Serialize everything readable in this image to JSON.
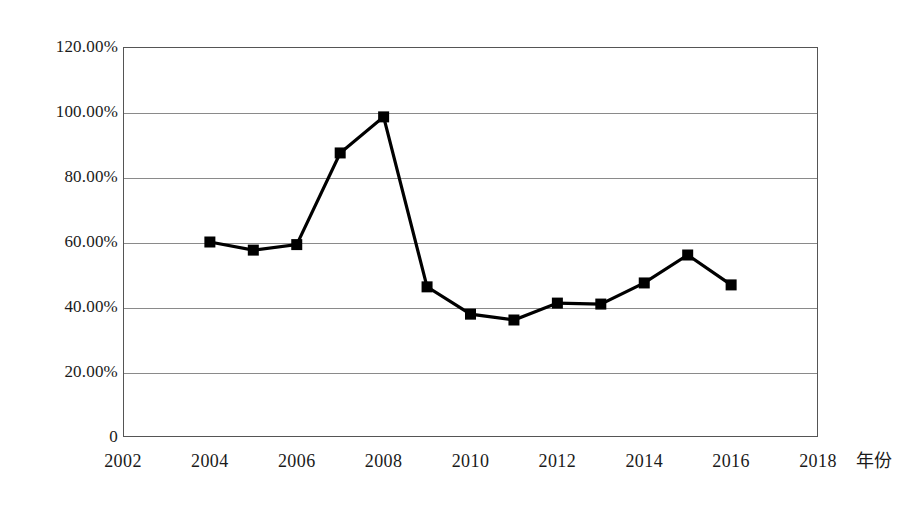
{
  "chart_data": {
    "type": "line",
    "title": "",
    "subtitle": "",
    "xlabel": "年份",
    "ylabel": "",
    "x": [
      2004,
      2005,
      2006,
      2007,
      2008,
      2009,
      2010,
      2011,
      2012,
      2013,
      2014,
      2015,
      2016
    ],
    "values": [
      60.0,
      57.5,
      59.2,
      87.4,
      98.5,
      46.2,
      37.8,
      36.0,
      41.2,
      40.9,
      47.4,
      56.0,
      46.8
    ],
    "series": [
      {
        "name": "",
        "values": [
          60.0,
          57.5,
          59.2,
          87.4,
          98.5,
          46.2,
          37.8,
          36.0,
          41.2,
          40.9,
          47.4,
          56.0,
          46.8
        ]
      }
    ],
    "xlim": [
      2002,
      2018
    ],
    "ylim": [
      0,
      120
    ],
    "x_ticks": [
      2002,
      2004,
      2006,
      2008,
      2010,
      2012,
      2014,
      2016,
      2018
    ],
    "x_tick_labels": [
      "2002",
      "2004",
      "2006",
      "2008",
      "2010",
      "2012",
      "2014",
      "2016",
      "2018"
    ],
    "y_ticks": [
      0,
      20,
      40,
      60,
      80,
      100,
      120
    ],
    "y_tick_labels": [
      "0",
      "20.00%",
      "40.00%",
      "60.00%",
      "80.00%",
      "100.00%",
      "120.00%"
    ],
    "grid": true,
    "grid_axis": "y",
    "legend": false,
    "legend_position": "none",
    "marker": "square",
    "line_color": "#000000",
    "marker_color": "#000000",
    "grid_color": "#8a8a8a",
    "frame_color": "#555555",
    "background_color": "#ffffff",
    "annotations": []
  },
  "axis_title": "年份"
}
